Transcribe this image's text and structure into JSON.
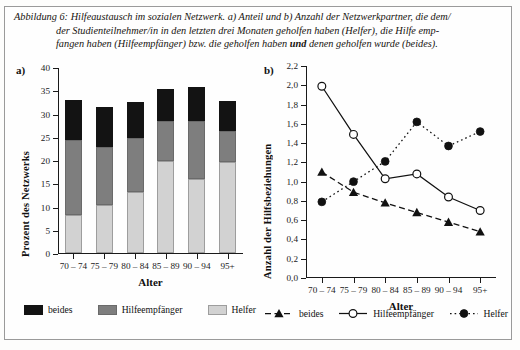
{
  "caption": {
    "line1": "Abbildung 6: Hilfeaustausch im sozialen Netzwerk. a) Anteil und b) Anzahl der Netzwerkpartner, die dem/",
    "line2": "der Studienteilnehmer/in in den letzten drei Monaten geholfen haben (Helfer), die Hilfe emp-",
    "line3_pre": "fangen haben (Hilfeempfänger) bzw. die geholfen haben ",
    "line3_bold": "und",
    "line3_post": " denen geholfen wurde (beides)."
  },
  "panel_a": {
    "label": "a)",
    "chart_data": {
      "type": "bar",
      "title": "",
      "xlabel": "Alter",
      "ylabel": "Prozent des Netzwerks",
      "categories": [
        "70 – 74",
        "75 – 79",
        "80 – 84",
        "85 – 89",
        "90 – 94",
        "95+"
      ],
      "ylim": [
        0,
        40
      ],
      "yticks": [
        0,
        5,
        10,
        15,
        20,
        25,
        30,
        35,
        40
      ],
      "ytick_labels": [
        "0",
        "5",
        "10",
        "15",
        "20",
        "25",
        "30",
        "35",
        "40"
      ],
      "grid": false,
      "stacked": true,
      "legend_position": "bottom",
      "series": [
        {
          "name": "Helfer",
          "color": "#d2d2d2",
          "values": [
            8.2,
            10.3,
            13.1,
            19.7,
            16.0,
            19.5
          ]
        },
        {
          "name": "Hilfeempfänger",
          "color": "#7e7e7e",
          "values": [
            16.0,
            12.4,
            11.7,
            8.6,
            12.3,
            6.7
          ]
        },
        {
          "name": "beides",
          "color": "#131313",
          "values": [
            8.8,
            8.8,
            7.6,
            6.9,
            7.4,
            6.5
          ]
        }
      ],
      "cumulative_tops": [
        [
          8.2,
          24.2,
          33.0
        ],
        [
          10.3,
          22.7,
          31.5
        ],
        [
          13.1,
          24.8,
          32.4
        ],
        [
          19.7,
          28.3,
          35.2
        ],
        [
          16.0,
          28.3,
          35.7
        ],
        [
          19.5,
          26.2,
          32.7
        ]
      ]
    },
    "legend": [
      {
        "label": "beides",
        "swatch": "black-square-swatch"
      },
      {
        "label": "Hilfeempfänger",
        "swatch": "gray-square-swatch"
      },
      {
        "label": "Helfer",
        "swatch": "lightgray-square-swatch"
      }
    ]
  },
  "panel_b": {
    "label": "b)",
    "chart_data": {
      "type": "line",
      "title": "",
      "xlabel": "Alter",
      "ylabel": "Anzahl der Hilfsbeziehungen",
      "categories": [
        "70 – 74",
        "75 – 79",
        "80 – 84",
        "85 – 89",
        "90 – 94",
        "95+"
      ],
      "ylim": [
        0.0,
        2.2
      ],
      "yticks": [
        0.0,
        0.2,
        0.4,
        0.6,
        0.8,
        1.0,
        1.2,
        1.4,
        1.6,
        1.8,
        2.0,
        2.2
      ],
      "ytick_labels": [
        "0,0",
        "0,2",
        "0,4",
        "0,6",
        "0,8",
        "1,0",
        "1,2",
        "1,4",
        "1,6",
        "1,8",
        "2,0",
        "2,2"
      ],
      "grid": false,
      "legend_position": "bottom",
      "series": [
        {
          "name": "beides",
          "marker": "filled-triangle",
          "linestyle": "dashed",
          "values": [
            1.1,
            0.89,
            0.78,
            0.68,
            0.58,
            0.48
          ]
        },
        {
          "name": "Hilfeempfänger",
          "marker": "open-circle",
          "linestyle": "solid",
          "values": [
            1.99,
            1.49,
            1.03,
            1.08,
            0.84,
            0.7
          ]
        },
        {
          "name": "Helfer",
          "marker": "filled-circle",
          "linestyle": "dotted",
          "values": [
            0.79,
            1.0,
            1.21,
            1.62,
            1.37,
            1.52
          ]
        }
      ]
    },
    "legend": [
      {
        "label": "beides",
        "marker": "filled-triangle-dashed-marker"
      },
      {
        "label": "Hilfeempfänger",
        "marker": "open-circle-solid-marker"
      },
      {
        "label": "Helfer",
        "marker": "filled-circle-dotted-marker"
      }
    ]
  }
}
